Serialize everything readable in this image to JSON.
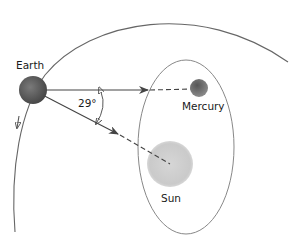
{
  "diagram": {
    "type": "orbital-geometry",
    "labels": {
      "earth": "Earth",
      "mercury": "Mercury",
      "sun": "Sun",
      "angle": "29°"
    },
    "colors": {
      "earth": "#5a5a5a",
      "mercury": "#6a6a6a",
      "sun": "#c8c8c8",
      "lines": "#555555",
      "background": "#ffffff"
    },
    "annotations": {
      "angle_degrees": 29
    }
  }
}
